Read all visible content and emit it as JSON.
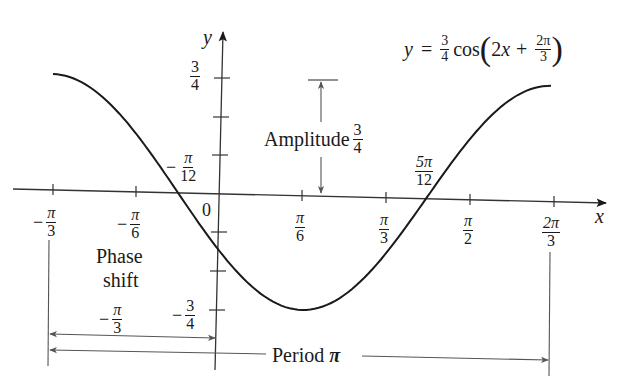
{
  "chart_data": {
    "type": "line",
    "function": "y = (3/4) * cos(2x + 2*pi/3)",
    "xlabel": "x",
    "ylabel": "y",
    "xlim": [
      -1.0472,
      2.0944
    ],
    "ylim": [
      -0.75,
      0.75
    ],
    "grid": false,
    "legend": "none",
    "x_ticks": [
      "-π/3",
      "-π/6",
      "0",
      "π/6",
      "π/3",
      "π/2",
      "2π/3"
    ],
    "y_ticks": [
      "3/4",
      "1/2",
      "1/4",
      "-1/4",
      "-1/2",
      "-3/4"
    ],
    "x": [
      -1.0472,
      -0.7854,
      -0.5236,
      -0.2618,
      0.0,
      0.2618,
      0.5236,
      0.7854,
      1.0472,
      1.309,
      1.5708,
      1.8326,
      2.0944
    ],
    "values": [
      0.75,
      0.6495,
      0.375,
      0.0,
      -0.375,
      -0.6495,
      -0.75,
      -0.6495,
      -0.375,
      0.0,
      0.375,
      0.6495,
      0.75
    ],
    "annotations": [
      {
        "text": "Amplitude 3/4",
        "type": "vertical double arrow from y=0 to y=3/4"
      },
      {
        "text": "Phase shift -π/3",
        "type": "horizontal double arrow from x=-π/3 to x=0"
      },
      {
        "text": "Period π",
        "type": "horizontal double arrow from x=-π/3 to x=2π/3"
      },
      {
        "text": "-π/12",
        "type": "zero crossing"
      },
      {
        "text": "5π/12",
        "type": "zero crossing"
      },
      {
        "text": "-3/4",
        "type": "minimum value label"
      }
    ]
  },
  "labels": {
    "y_axis": "y",
    "x_axis": "x",
    "origin": "0",
    "equation": {
      "lhs": "y",
      "eq": "=",
      "coef_num": "3",
      "coef_den": "4",
      "func": "cos",
      "inner": "2x",
      "plus": "+",
      "phase_num": "2π",
      "phase_den": "3"
    },
    "y_tick_top": {
      "num": "3",
      "den": "4"
    },
    "y_tick_bottom": {
      "neg": "−",
      "num": "3",
      "den": "4"
    },
    "x_ticks": [
      {
        "neg": "−",
        "num": "π",
        "den": "3"
      },
      {
        "neg": "−",
        "num": "π",
        "den": "6"
      },
      {
        "neg": "",
        "num": "π",
        "den": "6"
      },
      {
        "neg": "",
        "num": "π",
        "den": "3"
      },
      {
        "neg": "",
        "num": "π",
        "den": "2"
      },
      {
        "neg": "",
        "num": "2π",
        "den": "3"
      }
    ],
    "zero_left": {
      "neg": "−",
      "num": "π",
      "den": "12"
    },
    "zero_right": {
      "num": "5π",
      "den": "12"
    },
    "amplitude": {
      "text": "Amplitude",
      "num": "3",
      "den": "4"
    },
    "phase_shift": {
      "line1": "Phase",
      "line2": "shift",
      "neg": "−",
      "num": "π",
      "den": "3"
    },
    "period": {
      "text": "Period",
      "symbol": "π"
    }
  },
  "colors": {
    "curve": "#1a1a1a",
    "axis": "#333333",
    "annotation": "#555555",
    "background": "#ffffff"
  }
}
